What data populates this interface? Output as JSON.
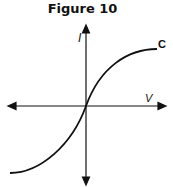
{
  "figure": {
    "title": "Figure 10",
    "y_axis_label": "I",
    "x_axis_label": "V",
    "curve_label": "C"
  },
  "colors": {
    "line": "#111111",
    "background": "#ffffff"
  }
}
